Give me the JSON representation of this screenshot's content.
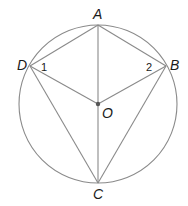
{
  "diagram": {
    "title": "",
    "stroke_color": "#8a8a8a",
    "text_color": "#1a1a1a",
    "circle": {
      "center": "O",
      "cx": 98,
      "cy": 104,
      "r": 79
    },
    "points": {
      "A": {
        "label": "A",
        "x": 98,
        "y": 25
      },
      "B": {
        "label": "B",
        "x": 166,
        "y": 66
      },
      "C": {
        "label": "C",
        "x": 98,
        "y": 183
      },
      "D": {
        "label": "D",
        "x": 30,
        "y": 66
      },
      "O": {
        "label": "O",
        "x": 98,
        "y": 104
      }
    },
    "segments": [
      "AD",
      "AB",
      "AO",
      "DO",
      "BO",
      "DC",
      "BC",
      "OC"
    ],
    "angles": [
      {
        "label": "1",
        "vertex": "D"
      },
      {
        "label": "2",
        "vertex": "B"
      }
    ]
  }
}
